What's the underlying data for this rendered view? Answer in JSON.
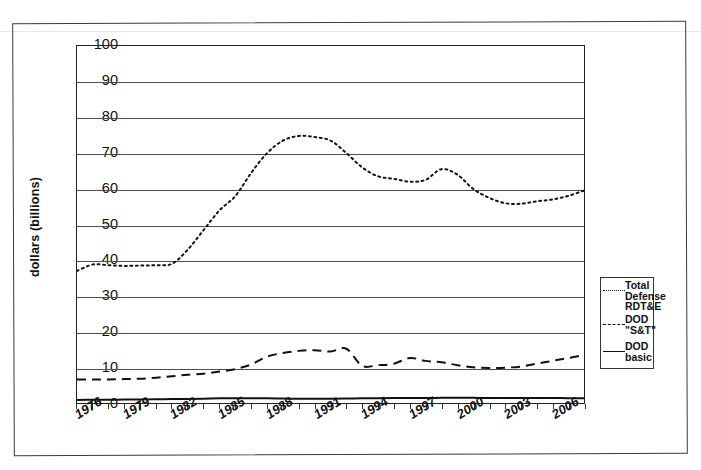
{
  "chart_data": {
    "type": "line",
    "title": "",
    "xlabel": "",
    "ylabel": "dollars (billions)",
    "ylim": [
      0,
      100
    ],
    "xlim": [
      1976,
      2008
    ],
    "grid": true,
    "legend_position": "right",
    "yticks": [
      0,
      10,
      20,
      30,
      40,
      50,
      60,
      70,
      80,
      90,
      100
    ],
    "xticks": [
      "1976",
      "1979",
      "1982",
      "1985",
      "1988",
      "1991",
      "1994",
      "1997",
      "2000",
      "2003",
      "2006"
    ],
    "x": [
      1976,
      1977,
      1978,
      1979,
      1980,
      1981,
      1982,
      1983,
      1984,
      1985,
      1986,
      1987,
      1988,
      1989,
      1990,
      1991,
      1992,
      1993,
      1994,
      1995,
      1996,
      1997,
      1998,
      1999,
      2000,
      2001,
      2002,
      2003,
      2004,
      2005,
      2006,
      2007,
      2008
    ],
    "series": [
      {
        "name": "Total Defense RDT&E",
        "style": "dotted",
        "values": [
          37.0,
          38.8,
          38.6,
          38.4,
          38.5,
          38.6,
          39.0,
          43.0,
          48.5,
          54.0,
          58.0,
          64.5,
          70.0,
          73.5,
          74.8,
          74.5,
          73.5,
          70.0,
          66.0,
          63.5,
          62.8,
          62.0,
          62.5,
          65.5,
          64.0,
          60.0,
          57.5,
          56.0,
          55.8,
          56.5,
          57.0,
          58.0,
          59.5
        ]
      },
      {
        "name": "DOD \"S&T\"",
        "style": "dashed",
        "values": [
          6.6,
          6.6,
          6.6,
          6.7,
          6.8,
          7.1,
          7.5,
          7.9,
          8.2,
          8.8,
          9.5,
          10.8,
          13.0,
          14.0,
          14.6,
          14.8,
          14.4,
          15.2,
          10.4,
          10.6,
          11.0,
          12.6,
          11.8,
          11.4,
          10.6,
          10.0,
          9.8,
          9.9,
          10.2,
          11.0,
          11.8,
          12.6,
          13.4
        ]
      },
      {
        "name": "DOD basic",
        "style": "solid",
        "values": [
          0.85,
          0.9,
          0.9,
          0.95,
          1.0,
          1.05,
          1.1,
          1.15,
          1.2,
          1.3,
          1.3,
          1.3,
          1.3,
          1.25,
          1.2,
          1.2,
          1.2,
          1.25,
          1.3,
          1.35,
          1.4,
          1.4,
          1.4,
          1.45,
          1.5,
          1.45,
          1.4,
          1.4,
          1.4,
          1.4,
          1.4,
          1.35,
          1.35
        ]
      }
    ],
    "series_extended": [
      {
        "name": "Total Defense RDT&E",
        "values_late": [
          72.0,
          80.0,
          86.0,
          90.5,
          92.5
        ]
      }
    ],
    "legend": [
      {
        "label": "Total\nDefense\nRDT&E",
        "style": "dotted"
      },
      {
        "label": "DOD\n\"S&T\"",
        "style": "dashed"
      },
      {
        "label": "DOD\nbasic",
        "style": "solid"
      }
    ]
  }
}
